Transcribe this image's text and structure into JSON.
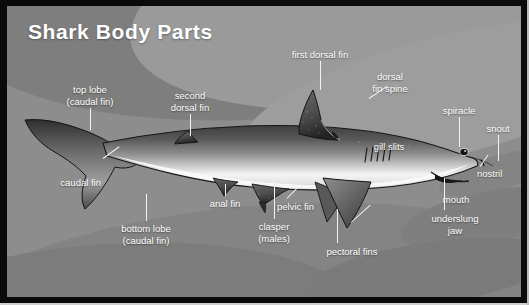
{
  "diagram": {
    "title": "Shark Body Parts",
    "subject": "shark",
    "view": "lateral left-facing-right profile",
    "colors": {
      "frame": "#0b0b0b",
      "background": "#8d8d8d",
      "background_band_dark": "#7e7e7e",
      "background_band_light": "#9a9a9a",
      "title_text": "#ffffff",
      "label_text": "#ffffff",
      "leader_line": "#f2f2f2",
      "shark_back": "#4a4a4a",
      "shark_flank": "#8f8f8f",
      "shark_belly": "#f0f0f0",
      "fin_dark": "#3a3a3a"
    },
    "labels": [
      {
        "id": "top-lobe-caudal-fin",
        "text": "top lobe\n(caudal fin)"
      },
      {
        "id": "caudal-fin",
        "text": "caudal fin"
      },
      {
        "id": "bottom-lobe-caudal-fin",
        "text": "bottom lobe\n(caudal fin)"
      },
      {
        "id": "second-dorsal-fin",
        "text": "second\ndorsal fin"
      },
      {
        "id": "anal-fin",
        "text": "anal fin"
      },
      {
        "id": "clasper-males",
        "text": "clasper\n(males)"
      },
      {
        "id": "pelvic-fin",
        "text": "pelvic fin"
      },
      {
        "id": "first-dorsal-fin",
        "text": "first dorsal fin"
      },
      {
        "id": "dorsal-fin-spine",
        "text": "dorsal\nfin spine"
      },
      {
        "id": "gill-slits",
        "text": "gill slits"
      },
      {
        "id": "pectoral-fins",
        "text": "pectoral fins"
      },
      {
        "id": "spiracle",
        "text": "spiracle"
      },
      {
        "id": "snout",
        "text": "snout"
      },
      {
        "id": "nostril",
        "text": "nostril"
      },
      {
        "id": "mouth",
        "text": "mouth"
      },
      {
        "id": "underslung-jaw",
        "text": "underslung\njaw"
      }
    ]
  }
}
